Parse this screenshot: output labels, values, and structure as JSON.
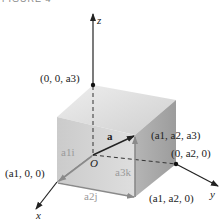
{
  "caption": "FIGURE 4",
  "axes": {
    "x": "x",
    "y": "y",
    "z": "z"
  },
  "origin_label": "O",
  "vector_label": "a",
  "points": {
    "z_point": "(0, 0, a3)",
    "tip": "(a1, a2, a3)",
    "y_point": "(0, a2, 0)",
    "x_point": "(a1, 0, 0)",
    "xy_point": "(a1, a2, 0)"
  },
  "components": {
    "i": "a1i",
    "j": "a2j",
    "k": "a3k"
  },
  "colors": {
    "axis": "#222222",
    "box_top": "#d9d9d9",
    "box_front": "#c9c9c9",
    "box_right": "#a8a8a8",
    "component_arrows": "#8a8a8a"
  }
}
